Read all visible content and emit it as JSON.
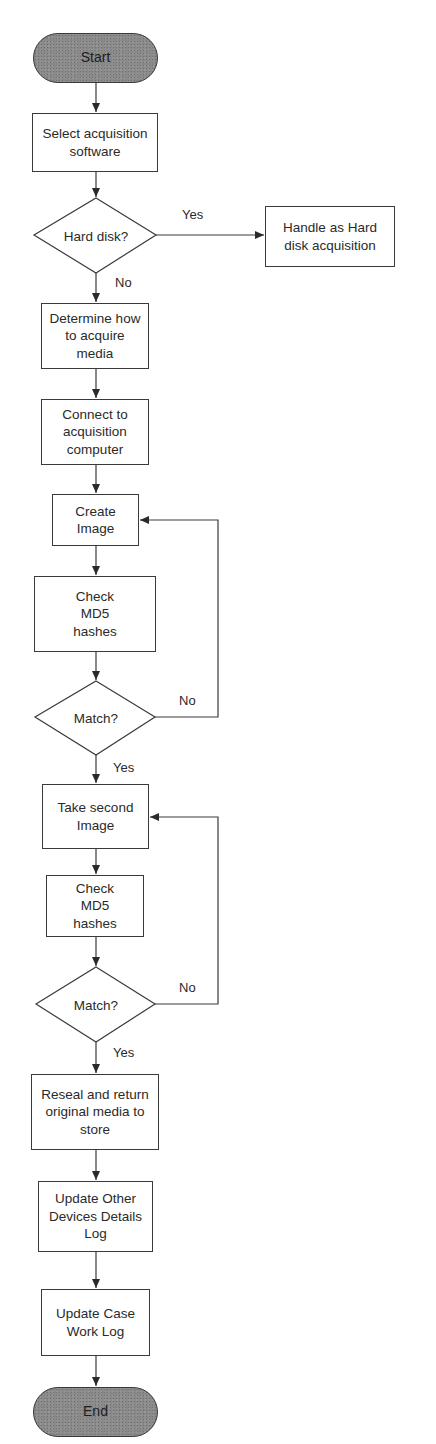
{
  "diagram": {
    "type": "flowchart",
    "colors": {
      "stroke": "#3a3a3a",
      "terminal_fill": "#8a8a8a",
      "background": "#ffffff",
      "text": "#2a2a2a"
    },
    "nodes": {
      "start": {
        "label": "Start",
        "shape": "terminal"
      },
      "select_software": {
        "label": "Select acquisition software",
        "shape": "process"
      },
      "hard_disk": {
        "label": "Hard disk?",
        "shape": "decision"
      },
      "handle_hard_disk": {
        "label": "Handle as Hard disk acquisition",
        "shape": "process"
      },
      "determine_how": {
        "label": "Determine how to acquire media",
        "shape": "process"
      },
      "connect": {
        "label": "Connect to acquisition computer",
        "shape": "process"
      },
      "create_image": {
        "label": "Create Image",
        "shape": "process"
      },
      "check_md5_1": {
        "label": "Check MD5 hashes",
        "shape": "process"
      },
      "match_1": {
        "label": "Match?",
        "shape": "decision"
      },
      "take_second": {
        "label": "Take second Image",
        "shape": "process"
      },
      "check_md5_2": {
        "label": "Check MD5 hashes",
        "shape": "process"
      },
      "match_2": {
        "label": "Match?",
        "shape": "decision"
      },
      "reseal": {
        "label": "Reseal and return original media to store",
        "shape": "process"
      },
      "update_other": {
        "label": "Update Other Devices Details Log",
        "shape": "process"
      },
      "update_case": {
        "label": "Update Case Work Log",
        "shape": "process"
      },
      "end": {
        "label": "End",
        "shape": "terminal"
      }
    },
    "edge_labels": {
      "hard_disk_yes": "Yes",
      "hard_disk_no": "No",
      "match1_no": "No",
      "match1_yes": "Yes",
      "match2_no": "No",
      "match2_yes": "Yes"
    },
    "edges": [
      {
        "from": "start",
        "to": "select_software"
      },
      {
        "from": "select_software",
        "to": "hard_disk"
      },
      {
        "from": "hard_disk",
        "to": "handle_hard_disk",
        "label": "Yes"
      },
      {
        "from": "hard_disk",
        "to": "determine_how",
        "label": "No"
      },
      {
        "from": "determine_how",
        "to": "connect"
      },
      {
        "from": "connect",
        "to": "create_image"
      },
      {
        "from": "create_image",
        "to": "check_md5_1"
      },
      {
        "from": "check_md5_1",
        "to": "match_1"
      },
      {
        "from": "match_1",
        "to": "create_image",
        "label": "No"
      },
      {
        "from": "match_1",
        "to": "take_second",
        "label": "Yes"
      },
      {
        "from": "take_second",
        "to": "check_md5_2"
      },
      {
        "from": "check_md5_2",
        "to": "match_2"
      },
      {
        "from": "match_2",
        "to": "take_second",
        "label": "No"
      },
      {
        "from": "match_2",
        "to": "reseal",
        "label": "Yes"
      },
      {
        "from": "reseal",
        "to": "update_other"
      },
      {
        "from": "update_other",
        "to": "update_case"
      },
      {
        "from": "update_case",
        "to": "end"
      }
    ]
  }
}
